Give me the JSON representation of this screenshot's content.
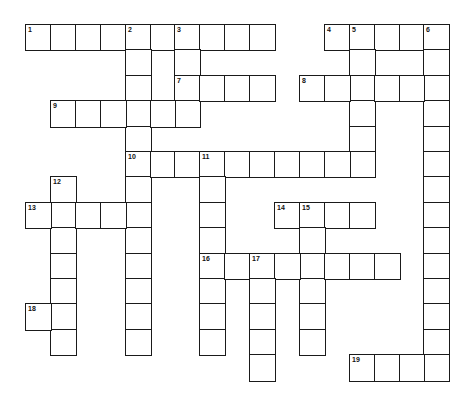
{
  "puzzle": {
    "type": "crossword",
    "grid": {
      "cols": 17,
      "rows": 14,
      "origin_x": 25,
      "origin_y": 24,
      "cell_w": 24.9,
      "cell_h": 25.4,
      "line_color": "#1a1a1a",
      "cell_color": "#ffffff"
    },
    "entries": [
      {
        "number": "1",
        "direction": "across",
        "row": 0,
        "col": 0,
        "length": 10
      },
      {
        "number": "2",
        "direction": "down",
        "row": 0,
        "col": 4,
        "length": 13
      },
      {
        "number": "3",
        "direction": "down",
        "row": 0,
        "col": 6,
        "length": 4
      },
      {
        "number": "4",
        "direction": "across",
        "row": 0,
        "col": 12,
        "length": 5
      },
      {
        "number": "5",
        "direction": "down",
        "row": 0,
        "col": 13,
        "length": 6
      },
      {
        "number": "6",
        "direction": "down",
        "row": 0,
        "col": 16,
        "length": 14
      },
      {
        "number": "7",
        "direction": "across",
        "row": 2,
        "col": 6,
        "length": 4
      },
      {
        "number": "8",
        "direction": "across",
        "row": 2,
        "col": 11,
        "length": 6
      },
      {
        "number": "9",
        "direction": "across",
        "row": 3,
        "col": 1,
        "length": 6
      },
      {
        "number": "10",
        "direction": "across",
        "row": 5,
        "col": 4,
        "length": 10
      },
      {
        "number": "11",
        "direction": "down",
        "row": 5,
        "col": 7,
        "length": 8
      },
      {
        "number": "12",
        "direction": "down",
        "row": 6,
        "col": 1,
        "length": 7
      },
      {
        "number": "13",
        "direction": "across",
        "row": 7,
        "col": 0,
        "length": 5
      },
      {
        "number": "14",
        "direction": "across",
        "row": 7,
        "col": 10,
        "length": 4
      },
      {
        "number": "15",
        "direction": "down",
        "row": 7,
        "col": 11,
        "length": 6
      },
      {
        "number": "16",
        "direction": "across",
        "row": 9,
        "col": 7,
        "length": 8
      },
      {
        "number": "17",
        "direction": "down",
        "row": 9,
        "col": 9,
        "length": 5
      },
      {
        "number": "18",
        "direction": "across",
        "row": 11,
        "col": 0,
        "length": 2
      },
      {
        "number": "19",
        "direction": "across",
        "row": 13,
        "col": 13,
        "length": 4
      }
    ]
  }
}
